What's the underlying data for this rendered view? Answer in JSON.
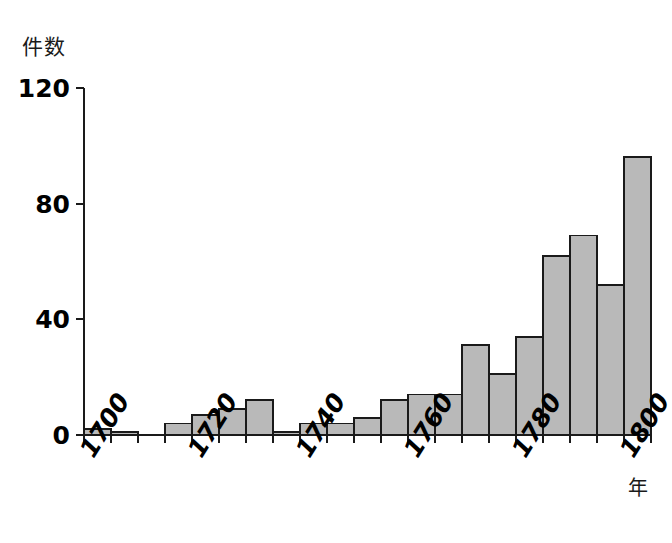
{
  "chart_data": {
    "type": "bar",
    "title": "",
    "xlabel": "年",
    "ylabel": "件数",
    "xlim": [
      1700,
      1805
    ],
    "ylim": [
      0,
      120
    ],
    "y_ticks": [
      0,
      40,
      80,
      120
    ],
    "y_tick_labels": [
      "0",
      "40",
      "80",
      "120"
    ],
    "x_ticks": [
      1700,
      1705,
      1710,
      1715,
      1720,
      1725,
      1730,
      1735,
      1740,
      1745,
      1750,
      1755,
      1760,
      1765,
      1770,
      1775,
      1780,
      1785,
      1790,
      1795,
      1800,
      1805
    ],
    "x_tick_labels": [
      "1700",
      "",
      "",
      "",
      "1720",
      "",
      "",
      "",
      "1740",
      "",
      "",
      "",
      "1760",
      "",
      "",
      "",
      "1780",
      "",
      "",
      "",
      "1800",
      ""
    ],
    "x_major_labels": [
      "1700",
      "1720",
      "1740",
      "1760",
      "1780",
      "1800"
    ],
    "bin_width_years": 5,
    "categories": [
      "1700",
      "1705",
      "1710",
      "1715",
      "1720",
      "1725",
      "1730",
      "1735",
      "1740",
      "1745",
      "1750",
      "1755",
      "1760",
      "1765",
      "1770",
      "1775",
      "1780",
      "1785",
      "1790",
      "1795",
      "1800"
    ],
    "values": [
      2,
      1,
      0,
      4,
      7,
      9,
      12,
      1,
      4,
      4,
      6,
      12,
      14,
      14,
      31,
      21,
      34,
      62,
      69,
      52,
      96
    ],
    "grid": false,
    "legend": null,
    "bar_fill": "#b9b9b9",
    "bar_stroke": "#1a1a1a",
    "axis_color": "#1a1a1a"
  },
  "geometry": {
    "x_origin_px": 84,
    "y_zero_px": 435,
    "y_top_px": 88,
    "bar_width_px": 27,
    "px_per_unit": 2.892,
    "tick_len_px": 8
  }
}
